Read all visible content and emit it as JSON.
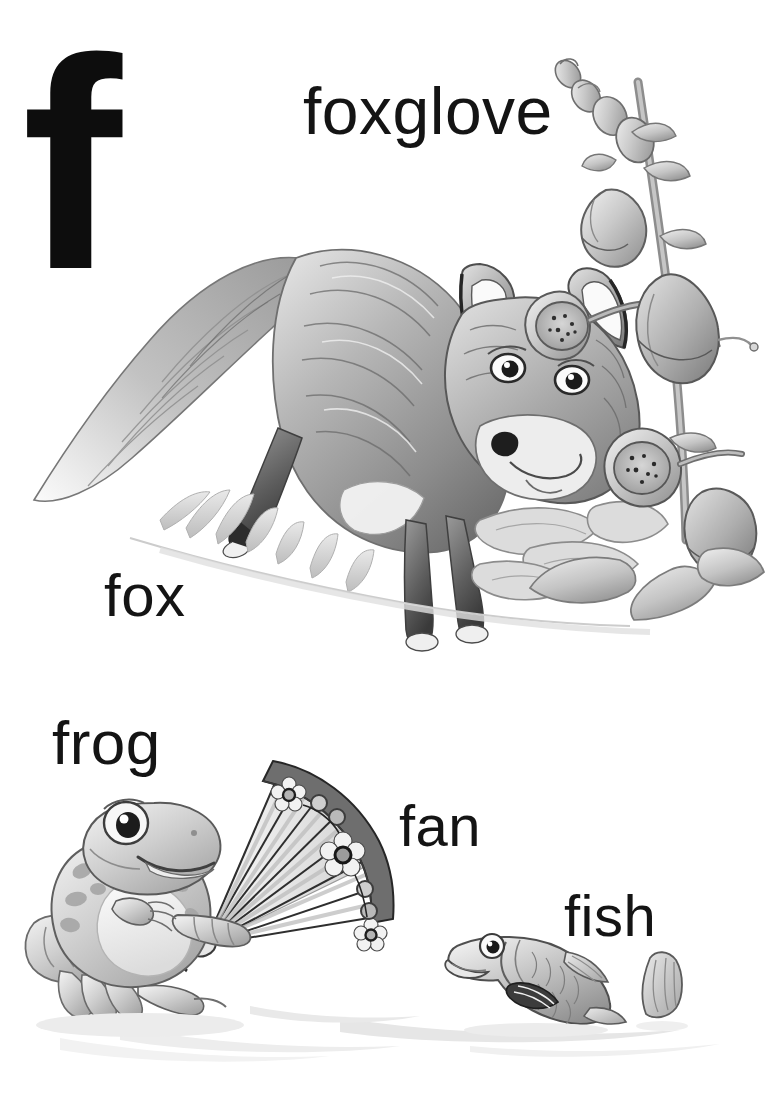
{
  "page": {
    "kind": "alphabet-picture-book-page",
    "letter": "f",
    "background_color": "#ffffff",
    "text_color": "#141414",
    "width": 765,
    "height": 1117
  },
  "labels": {
    "letter": "f",
    "foxglove": "foxglove",
    "fox": "fox",
    "frog": "frog",
    "fan": "fan",
    "fish": "fish"
  },
  "illustrations": [
    {
      "name": "foxglove",
      "description": "Tall foxglove flower spike with bell-shaped tubular blooms, spotted throats, buds at the tip and broad basal leaves",
      "style": "grayscale pencil airbrush",
      "colors": {
        "light": "#e8e8e8",
        "mid": "#b4b4b4",
        "dark": "#6e6e6e",
        "outline": "#4a4a4a"
      }
    },
    {
      "name": "fox",
      "description": "Fox crouching forward with bushy white-tipped tail raised, pointed ears, dark eyes and black nose, standing on grass",
      "style": "grayscale pencil airbrush",
      "colors": {
        "light": "#ededed",
        "mid": "#a9a9a9",
        "dark": "#5f5f5f",
        "outline": "#3b3b3b"
      }
    },
    {
      "name": "frog",
      "description": "Smiling spotted frog sitting upright on hind legs holding a folding fan",
      "style": "grayscale pencil airbrush",
      "colors": {
        "light": "#efefef",
        "mid": "#b0b0b0",
        "dark": "#787878",
        "outline": "#434343"
      }
    },
    {
      "name": "fan",
      "description": "Open folding fan with pale radiating ribs and a dark outer band decorated with white flowers and round dots",
      "style": "grayscale pencil airbrush",
      "colors": {
        "band": "#6d6d6d",
        "rib": "#d8d8d8",
        "flower": "#f2f2f2",
        "outline": "#2f2f2f"
      }
    },
    {
      "name": "fish",
      "description": "Scaled fish with large eye and open mouth, fins and a separate tail fin to the right",
      "style": "grayscale pencil airbrush",
      "colors": {
        "light": "#ececec",
        "mid": "#adadad",
        "dark": "#6a6a6a",
        "outline": "#3d3d3d"
      }
    }
  ]
}
